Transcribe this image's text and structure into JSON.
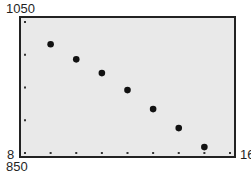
{
  "window": {
    "xmin": 8,
    "xmax": 16,
    "xscl": 1,
    "ymin": 850,
    "ymax": 1050,
    "yscl": 50
  },
  "labels": {
    "ymax": "1050",
    "ymin": "850",
    "xmin": "8",
    "xmax": "16"
  },
  "colors": {
    "frame_border": "#222222",
    "frame_fill": "#e9e9e9",
    "points": "#111111",
    "ticks": "#333333"
  },
  "chart_data": {
    "type": "scatter",
    "title": "",
    "xlabel": "",
    "ylabel": "",
    "xlim": [
      8,
      16
    ],
    "ylim": [
      850,
      1050
    ],
    "x_tick_step": 1,
    "y_tick_step": 50,
    "corner_labels": {
      "top_left": "1050",
      "bottom_left_x": "8",
      "bottom_left_y": "850",
      "bottom_right_x": "16"
    },
    "grid": false,
    "legend": null,
    "x": [
      9,
      10,
      11,
      12,
      13,
      14,
      15
    ],
    "y": [
      1016,
      993,
      972,
      946,
      917,
      888,
      859
    ]
  }
}
